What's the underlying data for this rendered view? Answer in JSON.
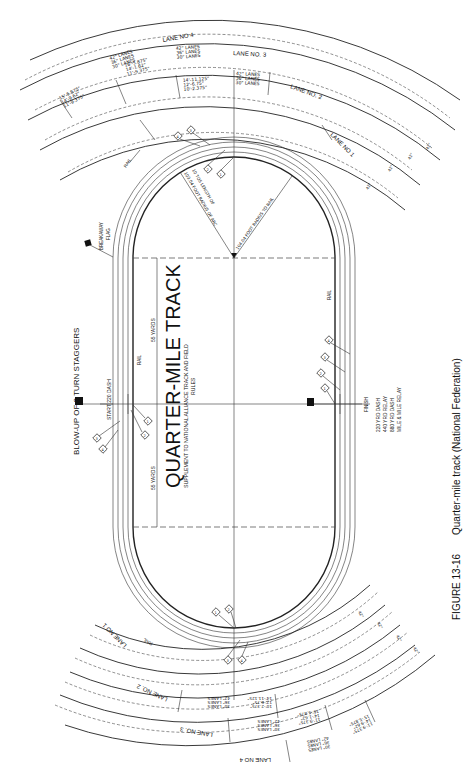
{
  "figure": {
    "number": "FIGURE 13-16",
    "caption": "Quarter-mile track (National Federation)"
  },
  "title": {
    "main": "QUARTER-MILE TRACK",
    "subtitle_line1": "SUPPLEMENT TO NATIONAL ALLIANCE TRACK AND FIELD",
    "subtitle_line2": "RULES"
  },
  "header": {
    "blowup": "BLOW-UP OF 2 TURN STAGGERS"
  },
  "labels": {
    "start": "START 220 DASH",
    "finish": "FINISH",
    "rail": "RAIL",
    "breakaway_flag_1": "BREAKAWAY",
    "breakaway_flag_2": "FLAG",
    "yards_left": "55 YARDS",
    "yards_right": "55 YARDS",
    "radius_rail": "104.04 FOOT RADIUS TO RAIL",
    "radius_arc_1": "103.04 FOOT RADIUS OF ARC",
    "radius_arc_2": "10 TOS LENGTH OF"
  },
  "finish_events": [
    "220 YRD DASH",
    "440 YRD RELAY",
    "880 YRD DASH",
    "MILE & MILE RELAY"
  ],
  "lanes": {
    "top": [
      "LANE NO 1",
      "LANE NO. 2",
      "LANE NO. 3",
      "LANE NO 4"
    ],
    "bottom": [
      "LANE NO 1",
      "LANE NO. 2",
      "LANE NO. 3",
      "LANE NO 4"
    ],
    "widths": [
      "42\"",
      "42\"",
      "42\"",
      "42\""
    ]
  },
  "staggers": {
    "lane2": {
      "values": [
        "14'-11.125\"",
        "12'-6.75\"",
        "10'-2.375\""
      ],
      "lanes": [
        "42\" LANES",
        "36\" LANES",
        "30\" LANES"
      ]
    },
    "lane3": {
      "values": [
        "16'-5.875\"",
        "14'-1.62\"",
        "11'-9.375\""
      ],
      "lanes": [
        "42\" LANES",
        "36\" LANES",
        "30\" LANES"
      ]
    },
    "lane4": {
      "values": [
        "15'-5.875\"",
        "14'-9.62\"",
        "11'-9.375\""
      ],
      "lanes": [
        "42\" LANES",
        "36\" LANES",
        "30\" LANES"
      ]
    }
  },
  "markers": [
    "1",
    "2",
    "3",
    "4"
  ]
}
